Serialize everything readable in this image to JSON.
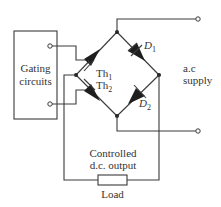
{
  "diagram": {
    "type": "single-phase half-controlled bridge rectifier",
    "gating_block": {
      "label_line1": "Gating",
      "label_line2": "circuits"
    },
    "components": {
      "thyristor_1": {
        "label": "Th",
        "subscript": "1"
      },
      "thyristor_2": {
        "label": "Th",
        "subscript": "2"
      },
      "diode_1": {
        "label": "D",
        "subscript": "1"
      },
      "diode_2": {
        "label": "D",
        "subscript": "2"
      },
      "load": {
        "label": "Load"
      }
    },
    "supply": {
      "label_line1": "a.c",
      "label_line2": "supply"
    },
    "output": {
      "label_line1": "Controlled",
      "label_line2": "d.c. output"
    },
    "colors": {
      "ink": "#3a3a3a",
      "background": "#ffffff"
    }
  }
}
